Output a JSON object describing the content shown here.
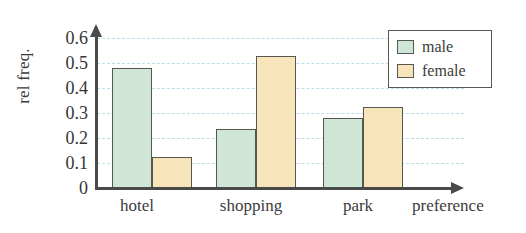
{
  "chart_data": {
    "type": "bar",
    "title": "",
    "xlabel": "preference",
    "ylabel": "rel freq.",
    "categories": [
      "hotel",
      "shopping",
      "park"
    ],
    "series": [
      {
        "name": "male",
        "color": "#cfe6d7",
        "values": [
          0.48,
          0.235,
          0.28
        ]
      },
      {
        "name": "female",
        "color": "#f8e4ba",
        "values": [
          0.125,
          0.53,
          0.325
        ]
      }
    ],
    "ylim": [
      0,
      0.6
    ],
    "yticks": [
      "0.6",
      "0.5",
      "0.4",
      "0.3",
      "0.2",
      "0.1",
      "0"
    ],
    "ytick_values": [
      0.6,
      0.5,
      0.4,
      0.3,
      0.2,
      0.1,
      0
    ],
    "grid": true,
    "grid_color": "#b8dde6",
    "legend_position": "top-right",
    "axis_color": "#4a4a4a",
    "bar_border_color": "#55584f",
    "background": "#ffffff"
  }
}
